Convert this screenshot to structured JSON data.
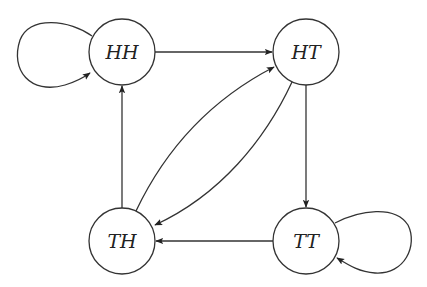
{
  "diagram": {
    "type": "state-transition-graph",
    "nodes": [
      {
        "id": "HH",
        "label": "HH",
        "x": 122,
        "y": 52
      },
      {
        "id": "HT",
        "label": "HT",
        "x": 306,
        "y": 52
      },
      {
        "id": "TH",
        "label": "TH",
        "x": 122,
        "y": 241
      },
      {
        "id": "TT",
        "label": "TT",
        "x": 306,
        "y": 241
      }
    ],
    "edges": [
      {
        "from": "HH",
        "to": "HH",
        "kind": "self-loop"
      },
      {
        "from": "HH",
        "to": "HT",
        "kind": "straight"
      },
      {
        "from": "HT",
        "to": "TT",
        "kind": "straight"
      },
      {
        "from": "TT",
        "to": "TT",
        "kind": "self-loop"
      },
      {
        "from": "TT",
        "to": "TH",
        "kind": "straight"
      },
      {
        "from": "TH",
        "to": "HH",
        "kind": "straight"
      },
      {
        "from": "TH",
        "to": "HT",
        "kind": "curved"
      },
      {
        "from": "HT",
        "to": "TH",
        "kind": "curved"
      }
    ],
    "colors": {
      "stroke": "#333333",
      "background": "#ffffff"
    }
  }
}
